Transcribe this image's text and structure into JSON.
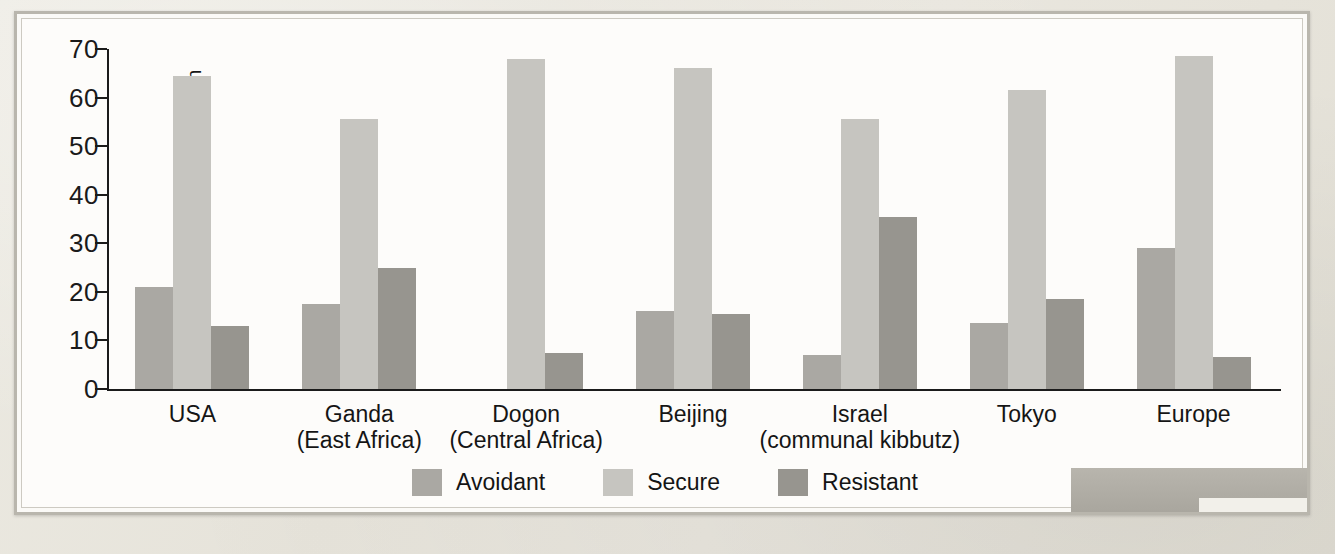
{
  "chart_data": {
    "type": "bar",
    "title": "",
    "xlabel": "",
    "ylabel": "Percent attachment classification",
    "ylim": [
      0,
      70
    ],
    "ytick_step": 10,
    "yticks": [
      70,
      60,
      50,
      40,
      30,
      20,
      10,
      0
    ],
    "grid": false,
    "legend_position": "bottom-center",
    "categories": [
      {
        "name": "USA",
        "sub": ""
      },
      {
        "name": "Ganda",
        "sub": "(East Africa)"
      },
      {
        "name": "Dogon",
        "sub": "(Central Africa)"
      },
      {
        "name": "Beijing",
        "sub": ""
      },
      {
        "name": "Israel",
        "sub": "(communal kibbutz)"
      },
      {
        "name": "Tokyo",
        "sub": ""
      },
      {
        "name": "Europe",
        "sub": ""
      }
    ],
    "series": [
      {
        "name": "Avoidant",
        "color": "#aaa8a3",
        "values": [
          21,
          17.5,
          0,
          16,
          7,
          13.5,
          29
        ]
      },
      {
        "name": "Secure",
        "color": "#c6c5c0",
        "values": [
          64.5,
          55.5,
          68,
          66,
          55.5,
          61.5,
          68.5
        ]
      },
      {
        "name": "Resistant",
        "color": "#97958f",
        "values": [
          13,
          25,
          7.5,
          15.5,
          35.5,
          18.5,
          6.5
        ]
      }
    ]
  },
  "legend": {
    "items": [
      {
        "label": "Avoidant",
        "color": "#aaa8a3"
      },
      {
        "label": "Secure",
        "color": "#c6c5c0"
      },
      {
        "label": "Resistant",
        "color": "#97958f"
      }
    ]
  },
  "axis": {
    "y_label": "Percent attachment classification"
  }
}
